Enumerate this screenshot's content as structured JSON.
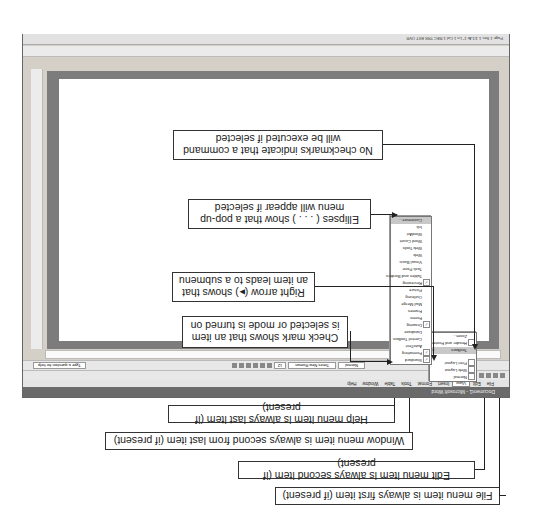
{
  "window": {
    "title": "Document1 - Microsoft Word",
    "menubar": [
      "File",
      "Edit",
      "View",
      "Insert",
      "Format",
      "Tools",
      "Table",
      "Window",
      "Help"
    ],
    "active_menu": "View",
    "status_text": "Page 1  Sec 1  1/1  At 1\"  Ln 1  Col 1  REC TRK EXT OVR",
    "formatting": {
      "style": "Normal",
      "font": "Times New Roman",
      "size": "12",
      "zoom": "100%"
    },
    "task_pane_search": "Type a question for help"
  },
  "view_menu": {
    "items": [
      {
        "label": "Normal",
        "icon": "normal-view-icon"
      },
      {
        "label": "Web Layout",
        "icon": "web-layout-icon"
      },
      {
        "label": "Print Layout",
        "icon": "print-layout-icon"
      },
      {
        "label": "Toolbars",
        "submenu": true,
        "highlighted": true
      },
      {
        "label": "Header and Footer",
        "icon": "header-footer-icon"
      },
      {
        "label": "Zoom..."
      }
    ]
  },
  "toolbars_menu": {
    "items": [
      {
        "label": "Standard",
        "checked": true
      },
      {
        "label": "Formatting",
        "checked": true
      },
      {
        "label": "AutoText"
      },
      {
        "label": "Control Toolbox"
      },
      {
        "label": "Database"
      },
      {
        "label": "Drawing",
        "checked": true
      },
      {
        "label": "Forms"
      },
      {
        "label": "Frames"
      },
      {
        "label": "Mail Merge"
      },
      {
        "label": "Outlining"
      },
      {
        "label": "Picture"
      },
      {
        "label": "Reviewing",
        "checked": true
      },
      {
        "label": "Tables and Borders"
      },
      {
        "label": "Task Pane"
      },
      {
        "label": "Visual Basic"
      },
      {
        "label": "Web"
      },
      {
        "label": "Web Tools"
      },
      {
        "label": "Word Count"
      },
      {
        "label": "WordArt"
      },
      {
        "label": "Ink"
      },
      {
        "label": "Customize..."
      }
    ]
  },
  "callouts": {
    "file": "File menu item is always first item (if present)",
    "edit": "Edit menu item is always second item (if present)",
    "window": "Window menu item is always second from last item (if present)",
    "help": "Help menu item is always last item (if present)",
    "checkmark": "Check mark shows that an item is selected or mode is turned on",
    "right_arrow": "Right arrow (▸) shows that an item leads to a submenu",
    "ellipses": "Ellipses ( . . . ) show that a pop-up menu will appear if selected",
    "no_checkmarks": "No checkmarks indicate that a command will be executed if selected"
  },
  "orientation": "rotated-180"
}
